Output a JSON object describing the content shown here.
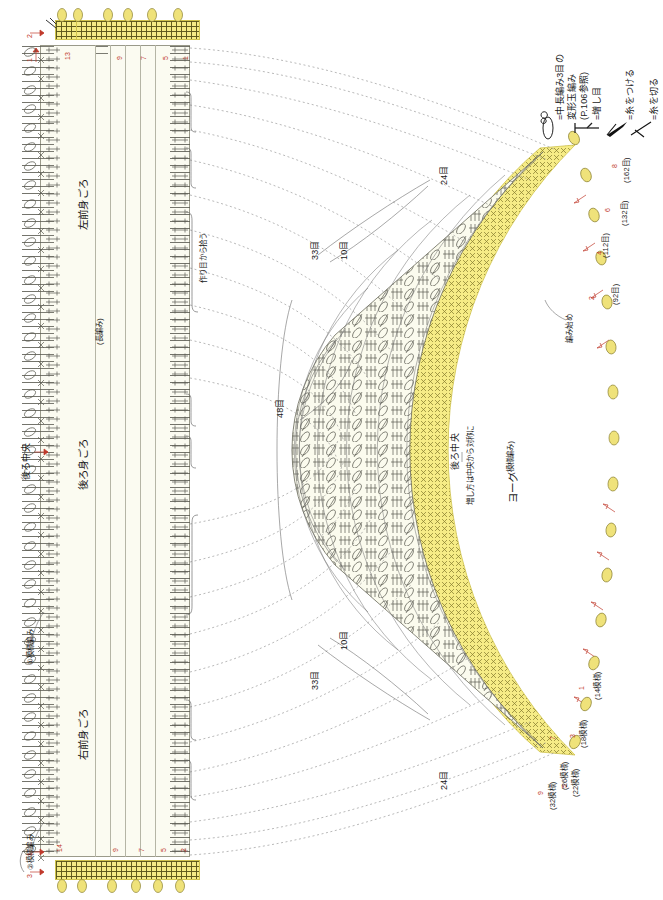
{
  "document": {
    "type": "japanese-crochet-pattern-chart",
    "orientation": "text-rotated-90-ccw",
    "background_color": "#ffffff",
    "accent_yellow": "#f6ec86",
    "panel_cream": "#fbfbf1",
    "ink": "#3a3a3a",
    "red": "#c0392b"
  },
  "legend": {
    "items": [
      {
        "symbol": "puff-stitch-icon",
        "text": "=中長編み3目の"
      },
      {
        "symbol": "",
        "text": "変形玉編み"
      },
      {
        "symbol": "",
        "text": "(P.106参照)"
      },
      {
        "symbol": "increase-icon",
        "text": "=増し目"
      },
      {
        "symbol": "join-yarn-icon",
        "text": "=糸をつける"
      },
      {
        "symbol": "cut-yarn-icon",
        "text": "=糸を切る"
      }
    ],
    "puff_label_line1": "=中長編み3目の",
    "puff_label_line2": "変形玉編み",
    "puff_label_line3": "(P.106参照)",
    "increase_label": "=増し目",
    "join_label": "=糸をつける",
    "cut_label": "=糸を切る"
  },
  "body_panels": {
    "left_front": {
      "label": "左前身ごろ",
      "note": "(長編み)"
    },
    "back": {
      "label": "後ろ身ごろ",
      "center_label": "後ろ中央",
      "pattern_note": "①模様編み"
    },
    "right_front": {
      "label": "右前身ごろ",
      "pattern_note": "②模様編み"
    },
    "pickup_note": "作り目から拾う",
    "top_rows": [
      "2",
      "1"
    ],
    "bottom_rows": [
      "1",
      "3"
    ],
    "edge_numbers_top": [
      "13",
      "9",
      "7",
      "5",
      "1"
    ],
    "edge_numbers_bottom": [
      "14",
      "9",
      "7",
      "5",
      "2"
    ]
  },
  "yoke": {
    "label": "ヨーク",
    "note": "(模様編み)",
    "center_label": "後ろ中央",
    "center_note": "増し方は中央から対称に",
    "start_label": "編み始め",
    "stitch_labels": [
      "24目",
      "33目",
      "10目",
      "48目",
      "33目",
      "10目",
      "24目"
    ],
    "top_rows": [
      {
        "row": "2",
        "count": "(92目)"
      },
      {
        "row": "4",
        "count": "(112目)"
      },
      {
        "row": "6",
        "count": "(132目)"
      },
      {
        "row": "8",
        "count": "(162目)"
      }
    ],
    "bottom_rows": [
      {
        "row": "1",
        "count": "(14模様)"
      },
      {
        "row": "3",
        "count": "(18模様)"
      },
      {
        "row": "5",
        "count": "(22模様)"
      },
      {
        "row": "7",
        "count": "(26模様)"
      },
      {
        "row": "9",
        "count": "(32模様)"
      }
    ]
  },
  "labels": {
    "back_center_left": "後ろ中央",
    "label_24_top": "24目",
    "label_33_top": "33目",
    "label_10_top": "10目",
    "label_48": "48目",
    "label_33_bot": "33目",
    "label_10_bot": "10目",
    "label_24_bot": "24目"
  }
}
